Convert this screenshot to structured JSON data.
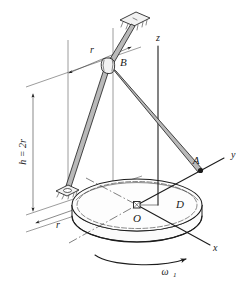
{
  "figure": {
    "kind": "engineering-mechanics-diagram",
    "background_color": "#ffffff",
    "line_color": "#1c1c1c"
  },
  "labels": {
    "point_B": "B",
    "point_A": "A",
    "point_O": "O",
    "body_D": "D",
    "axis_z": "z",
    "axis_y": "y",
    "axis_x": "x",
    "dim_r_top": "r",
    "dim_r_bottom": "r",
    "dim_height": "h = 2r",
    "omega": "ω",
    "omega_subscript": "1"
  },
  "geometry": {
    "disk_center": {
      "x": 137,
      "y": 205
    },
    "disk_rx": 65,
    "disk_ry": 26,
    "disk_thickness": 16,
    "joint_B": {
      "x": 108,
      "y": 64
    },
    "point_A": {
      "x": 200,
      "y": 168
    },
    "lower_support": {
      "x": 67,
      "y": 190
    },
    "upper_plate": {
      "x": 133,
      "y": 18
    },
    "z_axis_top": {
      "x": 158,
      "y": 42
    },
    "y_axis_end": {
      "x": 229,
      "y": 156
    },
    "x_axis_end": {
      "x": 214,
      "y": 250
    }
  },
  "dimensions": {
    "radius_label": "r",
    "height_label": "h = 2r"
  }
}
